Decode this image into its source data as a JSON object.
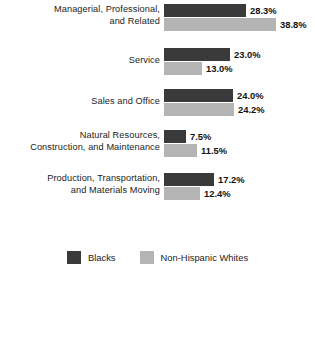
{
  "chart_data": {
    "type": "bar",
    "title": "",
    "subtitle": "",
    "xlabel": "",
    "ylabel": "",
    "orientation": "horizontal",
    "grid": false,
    "legend_position": "bottom-center",
    "value_suffix": "%",
    "axis_max": 40,
    "px_per_percent": 2.89,
    "categories": [
      "Managerial, Professional,\nand Related",
      "Service",
      "Sales and Office",
      "Natural Resources,\nConstruction, and Maintenance",
      "Production, Transportation,\nand Materials Moving"
    ],
    "series": [
      {
        "name": "Blacks",
        "color": "#3a3a3a",
        "values": [
          28.3,
          23.0,
          24.0,
          7.5,
          17.2
        ],
        "labels": [
          "28.3%",
          "23.0%",
          "24.0%",
          "7.5%",
          "17.2%"
        ]
      },
      {
        "name": "Non-Hispanic Whites",
        "color": "#b4b4b4",
        "values": [
          38.8,
          13.0,
          24.2,
          11.5,
          12.4
        ],
        "labels": [
          "38.8%",
          "13.0%",
          "24.2%",
          "11.5%",
          "12.4%"
        ]
      }
    ]
  },
  "groups": [
    {
      "label": "Managerial, Professional,\nand Related",
      "top": 3,
      "single_line": false,
      "bars": [
        {
          "series": "Blacks",
          "value": 28.3,
          "label": "28.3%"
        },
        {
          "series": "Non-Hispanic Whites",
          "value": 38.8,
          "label": "38.8%"
        }
      ]
    },
    {
      "label": "Service",
      "top": 47,
      "single_line": true,
      "bars": [
        {
          "series": "Blacks",
          "value": 23.0,
          "label": "23.0%"
        },
        {
          "series": "Non-Hispanic Whites",
          "value": 13.0,
          "label": "13.0%"
        }
      ]
    },
    {
      "label": "Sales and Office",
      "top": 88,
      "single_line": true,
      "bars": [
        {
          "series": "Blacks",
          "value": 24.0,
          "label": "24.0%"
        },
        {
          "series": "Non-Hispanic Whites",
          "value": 24.2,
          "label": "24.2%"
        }
      ]
    },
    {
      "label": "Natural Resources,\nConstruction, and Maintenance",
      "top": 129,
      "single_line": false,
      "bars": [
        {
          "series": "Blacks",
          "value": 7.5,
          "label": "7.5%"
        },
        {
          "series": "Non-Hispanic Whites",
          "value": 11.5,
          "label": "11.5%"
        }
      ]
    },
    {
      "label": "Production, Transportation,\nand Materials Moving",
      "top": 172,
      "single_line": false,
      "bars": [
        {
          "series": "Blacks",
          "value": 17.2,
          "label": "17.2%"
        },
        {
          "series": "Non-Hispanic Whites",
          "value": 12.4,
          "label": "12.4%"
        }
      ]
    }
  ],
  "legend": {
    "items": [
      {
        "label": "Blacks",
        "color": "#3a3a3a",
        "swatch": "dark"
      },
      {
        "label": "Non-Hispanic Whites",
        "color": "#b4b4b4",
        "swatch": "light"
      }
    ]
  }
}
